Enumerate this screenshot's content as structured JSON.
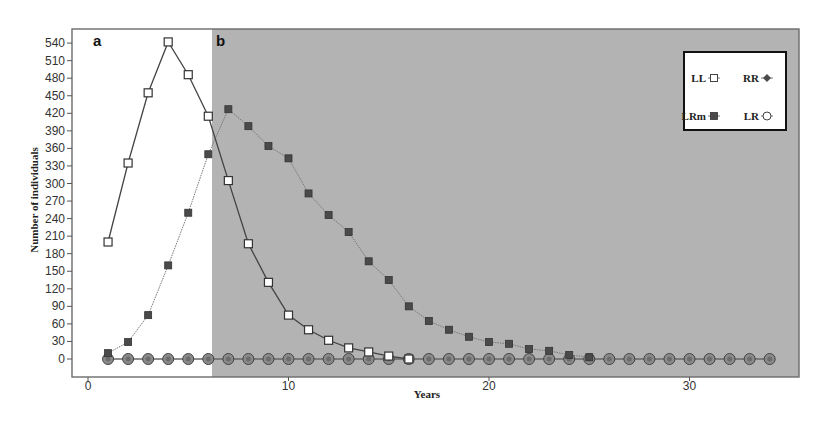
{
  "chart_data": {
    "type": "line",
    "title": "",
    "xlabel": "Years",
    "ylabel": "Number of individuals",
    "xlim": [
      0,
      35
    ],
    "ylim": [
      0,
      560
    ],
    "x_ticks": [
      0,
      10,
      20,
      30
    ],
    "y_ticks": [
      0,
      30,
      60,
      90,
      120,
      150,
      180,
      210,
      240,
      270,
      300,
      330,
      360,
      390,
      420,
      450,
      480,
      510,
      540
    ],
    "grid": false,
    "legend_position": "top-right",
    "panels": [
      {
        "label": "a",
        "x_start": 0,
        "x_end": 6,
        "background": "#ffffff"
      },
      {
        "label": "b",
        "x_start": 6,
        "x_end": 35.5,
        "background": "#b3b3b3"
      }
    ],
    "series": [
      {
        "name": "LL",
        "marker": "open-square",
        "line": "solid",
        "x": [
          1,
          2,
          3,
          4,
          5,
          6,
          7,
          8,
          9,
          10,
          11,
          12,
          13,
          14,
          15,
          16
        ],
        "values": [
          200,
          335,
          455,
          542,
          486,
          415,
          305,
          197,
          131,
          75,
          50,
          32,
          19,
          12,
          5,
          0
        ]
      },
      {
        "name": "RR",
        "marker": "filled-diamond",
        "line": "solid",
        "x": [
          1,
          2,
          3,
          4,
          5,
          6,
          7,
          8,
          9,
          10,
          11,
          12,
          13,
          14,
          15,
          16,
          17,
          18,
          19,
          20,
          21,
          22,
          23,
          24,
          25,
          26,
          27,
          28,
          29,
          30,
          31,
          32,
          33,
          34
        ],
        "values": [
          0,
          0,
          0,
          0,
          0,
          0,
          0,
          0,
          0,
          0,
          0,
          0,
          0,
          0,
          0,
          0,
          0,
          0,
          0,
          0,
          0,
          0,
          0,
          0,
          0,
          0,
          0,
          0,
          0,
          0,
          0,
          0,
          0,
          0
        ]
      },
      {
        "name": "LRm",
        "marker": "filled-square",
        "line": "dotted",
        "x": [
          1,
          2,
          3,
          4,
          5,
          6,
          7,
          8,
          9,
          10,
          11,
          12,
          13,
          14,
          15,
          16,
          17,
          18,
          19,
          20,
          21,
          22,
          23,
          24,
          25
        ],
        "values": [
          10,
          29,
          75,
          160,
          250,
          350,
          427,
          398,
          364,
          343,
          283,
          246,
          217,
          167,
          135,
          90,
          65,
          50,
          38,
          29,
          26,
          17,
          14,
          7,
          3
        ]
      },
      {
        "name": "LR",
        "marker": "open-circle",
        "line": "solid",
        "x": [
          1,
          2,
          3,
          4,
          5,
          6,
          7,
          8,
          9,
          10,
          11,
          12,
          13,
          14,
          15,
          16,
          17,
          18,
          19,
          20,
          21,
          22,
          23,
          24,
          25,
          26,
          27,
          28,
          29,
          30,
          31,
          32,
          33,
          34
        ],
        "values": [
          0,
          0,
          0,
          0,
          0,
          0,
          0,
          0,
          0,
          0,
          0,
          0,
          0,
          0,
          0,
          0,
          0,
          0,
          0,
          0,
          0,
          0,
          0,
          0,
          0,
          0,
          0,
          0,
          0,
          0,
          0,
          0,
          0,
          0
        ]
      }
    ]
  },
  "legend": {
    "items": [
      {
        "label": "LL",
        "marker": "open-square"
      },
      {
        "label": "RR",
        "marker": "filled-diamond"
      },
      {
        "label": "LRm",
        "marker": "filled-square"
      },
      {
        "label": "LR",
        "marker": "open-circle"
      }
    ]
  },
  "labels": {
    "panel_a": "a",
    "panel_b": "b",
    "x_title": "Years",
    "y_title": "Number of individuals"
  },
  "colors": {
    "panel_b_bg": "#b3b3b3",
    "axis": "#555555",
    "line": "#555555",
    "marker_fill_dark": "#4a4a4a",
    "marker_fill_light": "#ffffff"
  }
}
